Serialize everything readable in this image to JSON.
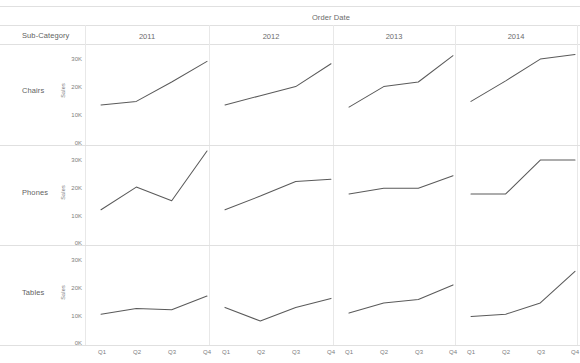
{
  "header": {
    "column_field_title": "Order Date",
    "corner_label": "Sub-Category"
  },
  "columns": [
    {
      "label": "2011"
    },
    {
      "label": "2012"
    },
    {
      "label": "2013"
    },
    {
      "label": "2014"
    }
  ],
  "rows": [
    {
      "label": "Chairs",
      "axis_title": "Sales"
    },
    {
      "label": "Phones",
      "axis_title": "Sales"
    },
    {
      "label": "Tables",
      "axis_title": "Sales"
    }
  ],
  "y_ticks": [
    "30K",
    "20K",
    "10K",
    "0K"
  ],
  "x_ticks": [
    "Q1",
    "Q2",
    "Q3",
    "Q4"
  ],
  "colors": {
    "line": "#5a5a5a",
    "grid": "#e8e8e8",
    "rule": "#e0e0e0",
    "text": "#6b6b6b",
    "background": "#ffffff"
  },
  "chart_data": {
    "type": "line",
    "title": "Order Date",
    "xlabel": "",
    "ylabel": "Sales",
    "ylim": [
      0,
      35000
    ],
    "y_tick_values": [
      0,
      10000,
      20000,
      30000
    ],
    "y_tick_labels": [
      "0K",
      "10K",
      "20K",
      "30K"
    ],
    "x": [
      "Q1",
      "Q2",
      "Q3",
      "Q4"
    ],
    "grid": false,
    "legend": "none",
    "layout": "small-multiples 3 rows (Sub-Category) x 4 columns (Order Date year)",
    "row_field": "Sub-Category",
    "column_field": "Order Date",
    "panels": [
      {
        "row": "Chairs",
        "column": "2011",
        "values": [
          11000,
          12500,
          21000,
          30000
        ]
      },
      {
        "row": "Chairs",
        "column": "2012",
        "values": [
          11000,
          15000,
          19000,
          29000
        ]
      },
      {
        "row": "Chairs",
        "column": "2013",
        "values": [
          10000,
          19000,
          21000,
          32500
        ]
      },
      {
        "row": "Chairs",
        "column": "2014",
        "values": [
          12500,
          21500,
          31000,
          33000
        ]
      },
      {
        "row": "Phones",
        "column": "2011",
        "values": [
          9000,
          19000,
          13000,
          35000
        ]
      },
      {
        "row": "Phones",
        "column": "2012",
        "values": [
          9000,
          15000,
          21500,
          22500
        ]
      },
      {
        "row": "Phones",
        "column": "2013",
        "values": [
          16000,
          18500,
          18500,
          24000
        ]
      },
      {
        "row": "Phones",
        "column": "2014",
        "values": [
          16000,
          16000,
          31000,
          31000
        ]
      },
      {
        "row": "Tables",
        "column": "2011",
        "values": [
          7000,
          9500,
          9000,
          15000
        ]
      },
      {
        "row": "Tables",
        "column": "2012",
        "values": [
          10000,
          4000,
          10000,
          14000
        ]
      },
      {
        "row": "Tables",
        "column": "2013",
        "values": [
          7500,
          12000,
          13500,
          20000
        ]
      },
      {
        "row": "Tables",
        "column": "2014",
        "values": [
          6000,
          7000,
          12000,
          26000
        ]
      }
    ]
  }
}
